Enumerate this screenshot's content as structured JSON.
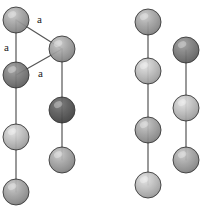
{
  "figure": {
    "type": "crystal-structure-diagram",
    "background_color": "#ffffff",
    "bond_color": "#555555",
    "bond_width": 1.2,
    "sphere_outline_color": "#2b2b2b",
    "labels": [
      {
        "id": "label-a-top",
        "text": "a",
        "x": 37,
        "y": 14
      },
      {
        "id": "label-a-left",
        "text": "a",
        "x": 4,
        "y": 42
      },
      {
        "id": "label-a-bottom",
        "text": "a",
        "x": 38,
        "y": 68
      }
    ],
    "bonds": [
      {
        "id": "bond-left-chain",
        "x1": 16,
        "y1": 20,
        "x2": 16,
        "y2": 192
      },
      {
        "id": "bond-second-chain",
        "x1": 62,
        "y1": 49,
        "x2": 62,
        "y2": 160
      },
      {
        "id": "bond-third-chain",
        "x1": 148,
        "y1": 22,
        "x2": 148,
        "y2": 185
      },
      {
        "id": "bond-fourth-chain",
        "x1": 186,
        "y1": 50,
        "x2": 186,
        "y2": 160
      },
      {
        "id": "bond-triangle-top",
        "x1": 16,
        "y1": 20,
        "x2": 62,
        "y2": 49
      },
      {
        "id": "bond-triangle-bottom",
        "x1": 16,
        "y1": 75,
        "x2": 62,
        "y2": 49
      }
    ],
    "spheres": [
      {
        "id": "atom-l1",
        "cx": 16,
        "cy": 20,
        "r": 13,
        "shade": "mid"
      },
      {
        "id": "atom-l2",
        "cx": 16,
        "cy": 75,
        "r": 13,
        "shade": "dark"
      },
      {
        "id": "atom-l3",
        "cx": 16,
        "cy": 137,
        "r": 13,
        "shade": "light"
      },
      {
        "id": "atom-l4",
        "cx": 16,
        "cy": 192,
        "r": 13,
        "shade": "mid"
      },
      {
        "id": "atom-m1",
        "cx": 62,
        "cy": 49,
        "r": 13,
        "shade": "mid"
      },
      {
        "id": "atom-m2",
        "cx": 62,
        "cy": 110,
        "r": 13,
        "shade": "darkest"
      },
      {
        "id": "atom-m3",
        "cx": 62,
        "cy": 160,
        "r": 13,
        "shade": "mid"
      },
      {
        "id": "atom-r1",
        "cx": 148,
        "cy": 22,
        "r": 13,
        "shade": "mid"
      },
      {
        "id": "atom-r2",
        "cx": 148,
        "cy": 71,
        "r": 13,
        "shade": "light"
      },
      {
        "id": "atom-r3",
        "cx": 148,
        "cy": 130,
        "r": 13,
        "shade": "mid"
      },
      {
        "id": "atom-r4",
        "cx": 148,
        "cy": 185,
        "r": 13,
        "shade": "light"
      },
      {
        "id": "atom-rr1",
        "cx": 186,
        "cy": 50,
        "r": 13,
        "shade": "dark"
      },
      {
        "id": "atom-rr2",
        "cx": 186,
        "cy": 108,
        "r": 13,
        "shade": "light"
      },
      {
        "id": "atom-rr3",
        "cx": 186,
        "cy": 160,
        "r": 13,
        "shade": "mid"
      }
    ]
  }
}
